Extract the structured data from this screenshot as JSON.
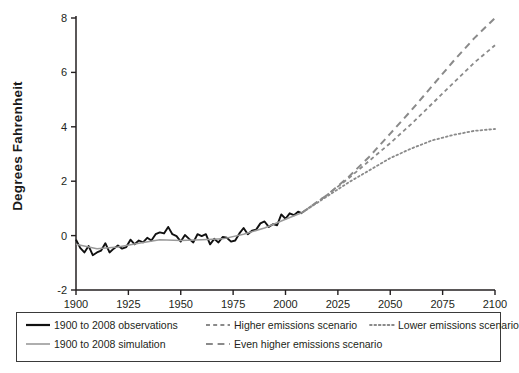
{
  "figure": {
    "background_color": "#ffffff",
    "axis_color": "#231f20"
  },
  "chart_data": {
    "type": "line",
    "title": "",
    "xlabel": "",
    "ylabel": "Degrees  Fahrenheit",
    "xlim": [
      1900,
      2100
    ],
    "ylim": [
      -2,
      8
    ],
    "xticks": [
      1900,
      1925,
      1950,
      1975,
      2000,
      2025,
      2050,
      2075,
      2100
    ],
    "yticks": [
      -2,
      0,
      2,
      4,
      6,
      8
    ],
    "grid": false,
    "legend_position": "below-axes",
    "series": [
      {
        "name": "1900 to 2008 observations",
        "style": "solid",
        "color": "#111111",
        "width": 1.9,
        "x": [
          1900,
          1902,
          1904,
          1906,
          1908,
          1910,
          1912,
          1914,
          1916,
          1918,
          1920,
          1922,
          1924,
          1926,
          1928,
          1930,
          1932,
          1934,
          1936,
          1938,
          1940,
          1942,
          1944,
          1946,
          1948,
          1950,
          1952,
          1954,
          1956,
          1958,
          1960,
          1962,
          1964,
          1966,
          1968,
          1970,
          1972,
          1974,
          1976,
          1978,
          1980,
          1982,
          1984,
          1986,
          1988,
          1990,
          1992,
          1994,
          1996,
          1998,
          2000,
          2002,
          2004,
          2006,
          2008
        ],
        "y": [
          -0.15,
          -0.45,
          -0.62,
          -0.38,
          -0.72,
          -0.62,
          -0.55,
          -0.28,
          -0.62,
          -0.48,
          -0.36,
          -0.48,
          -0.42,
          -0.15,
          -0.32,
          -0.18,
          -0.25,
          -0.08,
          -0.18,
          0.05,
          0.12,
          0.08,
          0.32,
          0.05,
          -0.02,
          -0.22,
          0.02,
          -0.12,
          -0.25,
          0.05,
          -0.02,
          0.05,
          -0.32,
          -0.12,
          -0.25,
          -0.05,
          -0.08,
          -0.22,
          -0.18,
          0.08,
          0.28,
          0.05,
          0.18,
          0.22,
          0.45,
          0.52,
          0.32,
          0.42,
          0.38,
          0.78,
          0.62,
          0.82,
          0.75,
          0.88,
          0.82
        ]
      },
      {
        "name": "1900 to 2008 simulation",
        "style": "solid",
        "color": "#9a9a9a",
        "width": 1.5,
        "x": [
          1900,
          1910,
          1920,
          1930,
          1940,
          1950,
          1960,
          1970,
          1980,
          1990,
          2000,
          2008
        ],
        "y": [
          -0.32,
          -0.48,
          -0.42,
          -0.28,
          -0.15,
          -0.18,
          -0.15,
          -0.12,
          0.05,
          0.28,
          0.6,
          0.85
        ]
      },
      {
        "name": "Even higher emissions scenario",
        "style": "dashed-long",
        "color": "#8a8a8a",
        "width": 2.0,
        "x": [
          2008,
          2020,
          2030,
          2040,
          2050,
          2060,
          2070,
          2080,
          2090,
          2100
        ],
        "y": [
          0.85,
          1.5,
          2.15,
          2.9,
          3.75,
          4.6,
          5.5,
          6.4,
          7.25,
          8.0
        ]
      },
      {
        "name": "Higher emissions scenario",
        "style": "dashed-short",
        "color": "#8a8a8a",
        "width": 1.8,
        "x": [
          2008,
          2020,
          2030,
          2040,
          2050,
          2060,
          2070,
          2080,
          2090,
          2100
        ],
        "y": [
          0.85,
          1.5,
          2.1,
          2.75,
          3.4,
          4.1,
          4.85,
          5.6,
          6.35,
          7.0
        ]
      },
      {
        "name": "Lower emissions scenario",
        "style": "dotted",
        "color": "#8a8a8a",
        "width": 1.8,
        "x": [
          2008,
          2020,
          2030,
          2040,
          2050,
          2060,
          2070,
          2080,
          2090,
          2100
        ],
        "y": [
          0.85,
          1.45,
          1.95,
          2.4,
          2.85,
          3.2,
          3.5,
          3.7,
          3.85,
          3.92
        ]
      }
    ]
  },
  "legend": {
    "entries": [
      {
        "label": "1900 to 2008 observations",
        "style": "solid",
        "color": "#111111",
        "width": 2.2,
        "column": 0,
        "row": 0
      },
      {
        "label": "1900 to 2008 simulation",
        "style": "solid",
        "color": "#9a9a9a",
        "width": 1.6,
        "column": 0,
        "row": 1
      },
      {
        "label": "Higher emissions scenario",
        "style": "dashed-short",
        "color": "#8a8a8a",
        "width": 1.8,
        "column": 1,
        "row": 0
      },
      {
        "label": "Even higher emissions scenario",
        "style": "dashed-long",
        "color": "#8a8a8a",
        "width": 2.0,
        "column": 1,
        "row": 1
      },
      {
        "label": "Lower emissions scenario",
        "style": "dotted",
        "color": "#8a8a8a",
        "width": 1.8,
        "column": 2,
        "row": 0
      }
    ]
  }
}
